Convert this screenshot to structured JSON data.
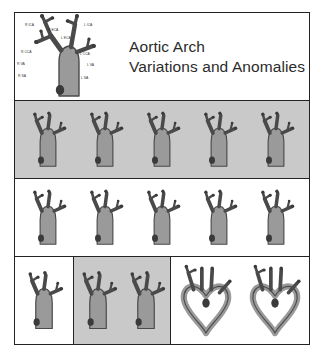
{
  "poster": {
    "title_line_1": "Aortic Arch",
    "title_line_2": "Variations and Anomalies",
    "colors": {
      "vessel_fill": "#9a9a9a",
      "vessel_outline": "#4a4a4a",
      "vessel_tip": "#3a3a3a",
      "panel_gray": "#c9c9c9",
      "panel_white": "#ffffff",
      "frame": "#222222",
      "title_text": "#2b2b2b"
    }
  },
  "header_figure": {
    "caption": "normal aortic arch branching diagram",
    "labels": [
      {
        "id": "r-ica",
        "text": "R ICA",
        "x": 10,
        "y": 9
      },
      {
        "id": "r-eca",
        "text": "R ECA",
        "x": 33,
        "y": 14
      },
      {
        "id": "l-ica",
        "text": "L ICA",
        "x": 69,
        "y": 9
      },
      {
        "id": "l-eca",
        "text": "L ECA",
        "x": 46,
        "y": 22
      },
      {
        "id": "r-cca",
        "text": "R CCA",
        "x": 6,
        "y": 36
      },
      {
        "id": "l-cca",
        "text": "L CCA",
        "x": 65,
        "y": 38
      },
      {
        "id": "r-va",
        "text": "R VA",
        "x": 2,
        "y": 48
      },
      {
        "id": "l-va",
        "text": "L VA",
        "x": 72,
        "y": 49
      },
      {
        "id": "r-sa",
        "text": "R SA",
        "x": 3,
        "y": 60
      },
      {
        "id": "l-sa",
        "text": "L SA",
        "x": 66,
        "y": 62
      }
    ]
  },
  "rows": [
    {
      "id": "row-variants-1",
      "background": "gray",
      "figure_count": 5,
      "figures": [
        {
          "id": "variant-1",
          "type": "arch"
        },
        {
          "id": "variant-2",
          "type": "arch"
        },
        {
          "id": "variant-3",
          "type": "arch"
        },
        {
          "id": "variant-4",
          "type": "arch"
        },
        {
          "id": "variant-5",
          "type": "arch"
        }
      ]
    },
    {
      "id": "row-variants-2",
      "background": "white",
      "figure_count": 5,
      "figures": [
        {
          "id": "variant-6",
          "type": "arch"
        },
        {
          "id": "variant-7",
          "type": "arch"
        },
        {
          "id": "variant-8",
          "type": "arch"
        },
        {
          "id": "variant-9",
          "type": "arch"
        },
        {
          "id": "variant-10",
          "type": "arch"
        }
      ]
    },
    {
      "id": "row-variants-3",
      "background": "mixed",
      "figure_count": 5,
      "panels": [
        {
          "id": "panel-a",
          "background": "white",
          "figure_count": 1,
          "figures": [
            {
              "id": "variant-11",
              "type": "arch"
            }
          ]
        },
        {
          "id": "panel-b",
          "background": "gray",
          "figure_count": 2,
          "figures": [
            {
              "id": "variant-12",
              "type": "arch"
            },
            {
              "id": "variant-13",
              "type": "arch"
            }
          ]
        },
        {
          "id": "panel-c",
          "background": "white",
          "figure_count": 2,
          "figures": [
            {
              "id": "variant-14",
              "type": "double-arch-ring"
            },
            {
              "id": "variant-15",
              "type": "double-arch-ring"
            }
          ]
        }
      ]
    }
  ]
}
